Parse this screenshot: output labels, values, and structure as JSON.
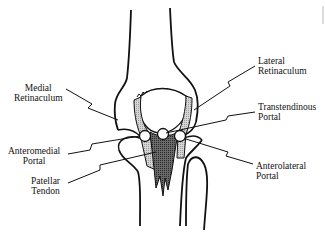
{
  "diagram": {
    "labels": {
      "medial_retinaculum": {
        "line1": "Medial",
        "line2": "Retinaculum"
      },
      "lateral_retinaculum": {
        "line1": "Lateral",
        "line2": "Retinaculum"
      },
      "transtendinous_portal": {
        "line1": "Transtendinous",
        "line2": "Portal"
      },
      "anteromedial_portal": {
        "line1": "Anteromedial",
        "line2": "Portal"
      },
      "patellar_tendon": {
        "line1": "Patellar",
        "line2": "Tendon"
      },
      "anterolateral_portal": {
        "line1": "Anterolateral",
        "line2": "Portal"
      }
    },
    "colors": {
      "outline": "#111111",
      "retinaculum_fill": "#c8c8c8",
      "tendon_fill": "#555555",
      "background": "#ffffff"
    }
  }
}
